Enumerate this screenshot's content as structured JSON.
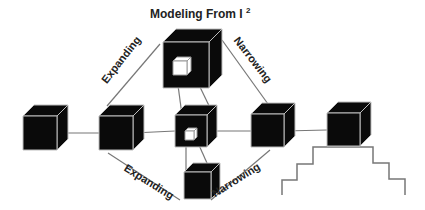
{
  "title": {
    "text": "Modeling From I",
    "superscript": "2"
  },
  "labels": [
    {
      "id": "expanding-top",
      "text": "Expanding",
      "x": 124,
      "y": 62,
      "angle": -52
    },
    {
      "id": "narrowing-top",
      "text": "Narrowing",
      "x": 250,
      "y": 62,
      "angle": 52
    },
    {
      "id": "expanding-bottom",
      "text": "Expanding",
      "x": 147,
      "y": 185,
      "angle": 32
    },
    {
      "id": "narrowing-bottom",
      "text": "Narrowing",
      "x": 238,
      "y": 183,
      "angle": -32
    }
  ],
  "cubes": [
    {
      "id": "cube-1",
      "x": 23,
      "y": 116,
      "size": 34,
      "depth": 11
    },
    {
      "id": "cube-2",
      "x": 99,
      "y": 116,
      "size": 34,
      "depth": 11
    },
    {
      "id": "cube-center",
      "x": 175,
      "y": 115,
      "size": 32,
      "depth": 10,
      "inner": {
        "x": 185,
        "y": 131,
        "size": 9,
        "depth": 3
      }
    },
    {
      "id": "cube-4",
      "x": 251,
      "y": 114,
      "size": 33,
      "depth": 11
    },
    {
      "id": "cube-5",
      "x": 327,
      "y": 113,
      "size": 33,
      "depth": 11
    },
    {
      "id": "cube-top",
      "x": 163,
      "y": 42,
      "size": 46,
      "depth": 13,
      "inner": {
        "x": 173,
        "y": 61,
        "size": 14,
        "depth": 4
      }
    },
    {
      "id": "cube-bottom",
      "x": 184,
      "y": 172,
      "size": 27,
      "depth": 9
    }
  ],
  "lines": [
    [
      57,
      133,
      99,
      133
    ],
    [
      133,
      133,
      175,
      131
    ],
    [
      217,
      131,
      251,
      131
    ],
    [
      284,
      131,
      327,
      130
    ],
    [
      107,
      106,
      160,
      44
    ],
    [
      222,
      40,
      268,
      104
    ],
    [
      108,
      153,
      180,
      200
    ],
    [
      211,
      200,
      270,
      150
    ],
    [
      175,
      63,
      182,
      115
    ],
    [
      187,
      60,
      213,
      114
    ],
    [
      186,
      140,
      186,
      172
    ],
    [
      194,
      134,
      211,
      172
    ]
  ],
  "staircase": "282,195 282,180 297,180 297,164 313,164 313,147 373,147 373,163 389,163 389,179 405,179 405,195",
  "colors": {
    "cube": "#0a0a0a",
    "edge": "#bdbdbd",
    "line": "#777777",
    "inner": "#ffffff"
  }
}
